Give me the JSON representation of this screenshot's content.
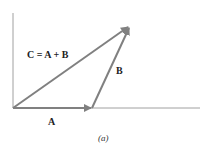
{
  "diagram": {
    "labels": {
      "c_equation": "C = A + B",
      "b": "B",
      "a": "A"
    },
    "caption": "(a)",
    "colors": {
      "vector": "#808080",
      "axis": "#a0a0a0"
    },
    "vectors": [
      {
        "name": "A",
        "from": [
          13,
          108
        ],
        "to": [
          92,
          108
        ]
      },
      {
        "name": "B",
        "from": [
          92,
          108
        ],
        "to": [
          130,
          26
        ]
      },
      {
        "name": "C",
        "from": [
          13,
          108
        ],
        "to": [
          130,
          26
        ]
      }
    ]
  }
}
